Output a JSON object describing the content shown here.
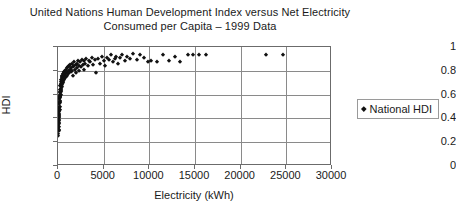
{
  "chart_data": {
    "type": "scatter",
    "title": "United Nations Human Development Index versus Net Electricity Consumed per Capita – 1999 Data",
    "title_lines": [
      "United Nations Human Development Index versus Net Electricity",
      "Consumed per Capita – 1999 Data"
    ],
    "xlabel": "Electricity (kWh)",
    "ylabel": "HDI",
    "xlim": [
      0,
      30000
    ],
    "ylim": [
      0,
      1
    ],
    "xticks": [
      0,
      5000,
      10000,
      15000,
      20000,
      25000,
      30000
    ],
    "xtick_labels": [
      "0",
      "5000",
      "10000",
      "15000",
      "20000",
      "25000",
      "30000"
    ],
    "yticks": [
      0,
      0.2,
      0.4,
      0.6,
      0.8,
      1
    ],
    "ytick_labels": [
      "0",
      "0.2",
      "0.4",
      "0.6",
      "0.8",
      "1"
    ],
    "grid": true,
    "legend_position": "right-outside",
    "marker": "diamond",
    "marker_color": "#111111",
    "series": [
      {
        "name": "National HDI",
        "points": [
          [
            30,
            0.27
          ],
          [
            40,
            0.31
          ],
          [
            45,
            0.25
          ],
          [
            50,
            0.34
          ],
          [
            55,
            0.29
          ],
          [
            60,
            0.38
          ],
          [
            65,
            0.33
          ],
          [
            70,
            0.42
          ],
          [
            75,
            0.36
          ],
          [
            80,
            0.3
          ],
          [
            85,
            0.45
          ],
          [
            90,
            0.4
          ],
          [
            95,
            0.35
          ],
          [
            100,
            0.47
          ],
          [
            110,
            0.43
          ],
          [
            115,
            0.5
          ],
          [
            120,
            0.39
          ],
          [
            125,
            0.46
          ],
          [
            130,
            0.53
          ],
          [
            140,
            0.44
          ],
          [
            145,
            0.49
          ],
          [
            150,
            0.56
          ],
          [
            155,
            0.41
          ],
          [
            160,
            0.52
          ],
          [
            170,
            0.58
          ],
          [
            175,
            0.47
          ],
          [
            180,
            0.54
          ],
          [
            190,
            0.6
          ],
          [
            195,
            0.5
          ],
          [
            200,
            0.57
          ],
          [
            210,
            0.62
          ],
          [
            215,
            0.53
          ],
          [
            220,
            0.59
          ],
          [
            230,
            0.64
          ],
          [
            240,
            0.55
          ],
          [
            250,
            0.61
          ],
          [
            255,
            0.67
          ],
          [
            265,
            0.58
          ],
          [
            275,
            0.63
          ],
          [
            285,
            0.69
          ],
          [
            295,
            0.6
          ],
          [
            305,
            0.65
          ],
          [
            315,
            0.71
          ],
          [
            325,
            0.62
          ],
          [
            340,
            0.66
          ],
          [
            355,
            0.72
          ],
          [
            365,
            0.64
          ],
          [
            380,
            0.68
          ],
          [
            395,
            0.74
          ],
          [
            410,
            0.66
          ],
          [
            425,
            0.7
          ],
          [
            440,
            0.75
          ],
          [
            455,
            0.68
          ],
          [
            470,
            0.72
          ],
          [
            490,
            0.76
          ],
          [
            510,
            0.7
          ],
          [
            530,
            0.73
          ],
          [
            550,
            0.77
          ],
          [
            570,
            0.71
          ],
          [
            590,
            0.74
          ],
          [
            610,
            0.78
          ],
          [
            630,
            0.72
          ],
          [
            650,
            0.75
          ],
          [
            680,
            0.79
          ],
          [
            700,
            0.73
          ],
          [
            730,
            0.76
          ],
          [
            760,
            0.8
          ],
          [
            790,
            0.74
          ],
          [
            820,
            0.77
          ],
          [
            850,
            0.81
          ],
          [
            880,
            0.75
          ],
          [
            910,
            0.78
          ],
          [
            950,
            0.82
          ],
          [
            980,
            0.76
          ],
          [
            1020,
            0.79
          ],
          [
            1060,
            0.83
          ],
          [
            1100,
            0.77
          ],
          [
            1150,
            0.8
          ],
          [
            1200,
            0.84
          ],
          [
            1250,
            0.78
          ],
          [
            1300,
            0.81
          ],
          [
            1350,
            0.85
          ],
          [
            1400,
            0.79
          ],
          [
            1450,
            0.82
          ],
          [
            1500,
            0.86
          ],
          [
            1560,
            0.8
          ],
          [
            1620,
            0.83
          ],
          [
            1680,
            0.76
          ],
          [
            1740,
            0.84
          ],
          [
            1800,
            0.87
          ],
          [
            1860,
            0.81
          ],
          [
            1920,
            0.85
          ],
          [
            1980,
            0.78
          ],
          [
            2050,
            0.86
          ],
          [
            2120,
            0.82
          ],
          [
            2200,
            0.88
          ],
          [
            2280,
            0.84
          ],
          [
            2350,
            0.8
          ],
          [
            2430,
            0.87
          ],
          [
            2500,
            0.83
          ],
          [
            2600,
            0.89
          ],
          [
            2700,
            0.85
          ],
          [
            2800,
            0.81
          ],
          [
            2900,
            0.88
          ],
          [
            3000,
            0.86
          ],
          [
            3100,
            0.9
          ],
          [
            3250,
            0.84
          ],
          [
            3400,
            0.88
          ],
          [
            3550,
            0.87
          ],
          [
            3700,
            0.91
          ],
          [
            3850,
            0.85
          ],
          [
            4000,
            0.89
          ],
          [
            4200,
            0.78
          ],
          [
            4400,
            0.9
          ],
          [
            4600,
            0.86
          ],
          [
            4800,
            0.92
          ],
          [
            5000,
            0.88
          ],
          [
            5200,
            0.84
          ],
          [
            5400,
            0.91
          ],
          [
            5600,
            0.89
          ],
          [
            5800,
            0.93
          ],
          [
            6000,
            0.87
          ],
          [
            6200,
            0.9
          ],
          [
            6400,
            0.92
          ],
          [
            6600,
            0.86
          ],
          [
            6800,
            0.91
          ],
          [
            7000,
            0.93
          ],
          [
            7300,
            0.88
          ],
          [
            7600,
            0.92
          ],
          [
            7900,
            0.9
          ],
          [
            8200,
            0.94
          ],
          [
            8600,
            0.89
          ],
          [
            9000,
            0.93
          ],
          [
            9400,
            0.91
          ],
          [
            9800,
            0.87
          ],
          [
            10200,
            0.88
          ],
          [
            10800,
            0.87
          ],
          [
            11500,
            0.93
          ],
          [
            12200,
            0.88
          ],
          [
            12800,
            0.92
          ],
          [
            13400,
            0.87
          ],
          [
            14200,
            0.93
          ],
          [
            14800,
            0.93
          ],
          [
            15400,
            0.93
          ],
          [
            16200,
            0.93
          ],
          [
            22800,
            0.93
          ],
          [
            24600,
            0.93
          ]
        ]
      }
    ]
  },
  "legend": {
    "label": "National HDI"
  }
}
